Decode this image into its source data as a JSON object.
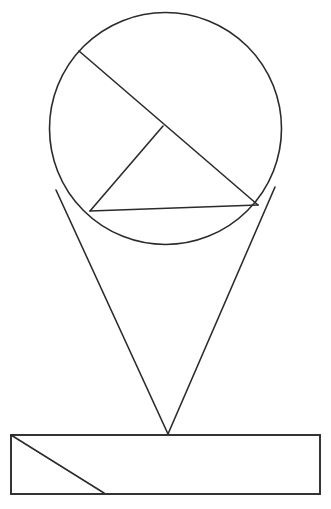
{
  "canvas": {
    "width": 331,
    "height": 509,
    "background_color": "#ffffff"
  },
  "style": {
    "stroke_color": "#2b2b2b",
    "stroke_width_thin": 1.6,
    "stroke_width_thick": 1.9,
    "fill": "none"
  },
  "shapes": {
    "circle": {
      "name": "circle",
      "cx": 165.5,
      "cy": 128.5,
      "r": 116
    },
    "chord_diagonal": {
      "name": "long-diagonal-chord",
      "x1": 79,
      "y1": 51,
      "x2": 258,
      "y2": 205
    },
    "chord_perpendicular": {
      "name": "short-perpendicular-segment",
      "x1": 163,
      "y1": 126,
      "x2": 90,
      "y2": 211
    },
    "chord_horizontal": {
      "name": "lower-horizontal-chord",
      "x1": 90,
      "y1": 211,
      "x2": 258,
      "y2": 205
    },
    "cone_left": {
      "name": "cone-left-edge",
      "x1": 56,
      "y1": 190,
      "x2": 168,
      "y2": 434
    },
    "cone_right": {
      "name": "cone-right-edge",
      "x1": 275,
      "y1": 187,
      "x2": 168,
      "y2": 434
    },
    "rectangle": {
      "name": "base-rectangle",
      "x": 11,
      "y": 435,
      "width": 309,
      "height": 59
    },
    "rectangle_diagonal": {
      "name": "rectangle-diagonal",
      "x1": 11,
      "y1": 435,
      "x2": 104,
      "y2": 493
    }
  },
  "points": {
    "apex": {
      "name": "cone-apex",
      "x": 168,
      "y": 434
    },
    "chord_intersection": {
      "name": "chord-intersection-point",
      "x": 163,
      "y": 126
    }
  }
}
